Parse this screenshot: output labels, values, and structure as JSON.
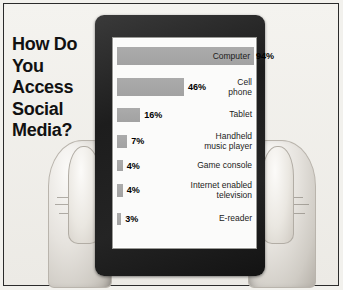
{
  "poster": {
    "headline_lines": [
      "How Do",
      "You",
      "Access",
      "Social",
      "Media?"
    ],
    "device": "tablet",
    "hands": [
      "left-hand",
      "right-hand"
    ]
  },
  "chart_data": {
    "type": "bar",
    "orientation": "horizontal",
    "title": "How Do You Access Social Media?",
    "xlabel": "",
    "ylabel": "",
    "xlim": [
      0,
      94
    ],
    "grid": false,
    "legend": null,
    "value_suffix": "%",
    "categories": [
      "Computer",
      "Cell phone",
      "Tablet",
      "Handheld music player",
      "Game console",
      "Internet enabled television",
      "E-reader"
    ],
    "values": [
      94,
      46,
      16,
      7,
      4,
      4,
      3
    ],
    "labels": [
      "94%",
      "46%",
      "16%",
      "7%",
      "4%",
      "4%",
      "3%"
    ],
    "bars": [
      {
        "name": "Computer",
        "value": 94,
        "label": "94%",
        "name_lines": "Computer",
        "label_inside_bar": true
      },
      {
        "name": "Cell phone",
        "value": 46,
        "label": "46%",
        "name_lines": "Cell\nphone",
        "label_inside_bar": false
      },
      {
        "name": "Tablet",
        "value": 16,
        "label": "16%",
        "name_lines": "Tablet",
        "label_inside_bar": false
      },
      {
        "name": "Handheld music player",
        "value": 7,
        "label": "7%",
        "name_lines": "Handheld\nmusic player",
        "label_inside_bar": false
      },
      {
        "name": "Game console",
        "value": 4,
        "label": "4%",
        "name_lines": "Game console",
        "label_inside_bar": false
      },
      {
        "name": "Internet enabled television",
        "value": 4,
        "label": "4%",
        "name_lines": "Internet enabled\ntelevision",
        "label_inside_bar": false
      },
      {
        "name": "E-reader",
        "value": 3,
        "label": "3%",
        "name_lines": "E-reader",
        "label_inside_bar": false
      }
    ],
    "colors": {
      "bar": "#ababab",
      "text": "#1b1b1b",
      "background": "#fbfbfa",
      "bezel": "#1d1d1d",
      "page": "#f2f1ed"
    }
  }
}
